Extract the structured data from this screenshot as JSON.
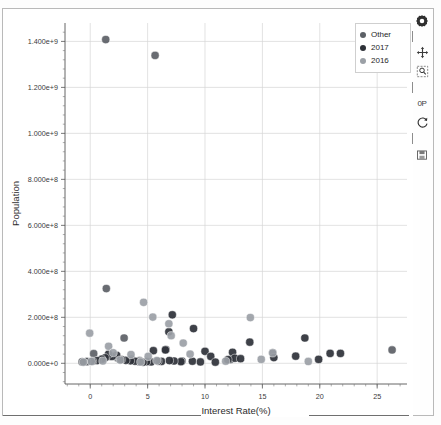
{
  "chart_data": {
    "type": "scatter",
    "title": "",
    "xlabel": "Interest Rate(%)",
    "ylabel": "Population",
    "xlim": [
      -2.2,
      27.6
    ],
    "ylim": [
      -90000000,
      1480000000
    ],
    "xticks": [
      0,
      5,
      10,
      15,
      20,
      25
    ],
    "xticklabels": [
      "0",
      "5",
      "10",
      "15",
      "20",
      "25"
    ],
    "yticks": [
      0,
      200000000,
      400000000,
      600000000,
      800000000,
      1000000000,
      1200000000,
      1400000000
    ],
    "yticklabels": [
      "0.000e+0",
      "2.000e+8",
      "4.000e+8",
      "6.000e+8",
      "8.000e+8",
      "1.000e+9",
      "1.200e+9",
      "1.400e+9"
    ],
    "grid": true,
    "legend_position": "top-right",
    "series": [
      {
        "name": "Other",
        "color": "#5c6066",
        "points": [
          [
            1.35,
            1408000000
          ],
          [
            5.65,
            1339000000
          ],
          [
            1.4,
            325000000
          ],
          [
            2.95,
            110000000
          ],
          [
            0.3,
            42000000
          ],
          [
            1.7,
            30000000
          ],
          [
            2.4,
            22000000
          ],
          [
            3.6,
            18000000
          ],
          [
            4.3,
            12000000
          ],
          [
            6.6,
            60000000
          ],
          [
            8.0,
            10000000
          ],
          [
            12.2,
            16000000
          ],
          [
            15.9,
            46000000
          ],
          [
            26.3,
            58000000
          ]
        ]
      },
      {
        "name": "2017",
        "color": "#2e3138",
        "points": [
          [
            7.15,
            211000000
          ],
          [
            6.85,
            137000000
          ],
          [
            9.0,
            151000000
          ],
          [
            13.9,
            92000000
          ],
          [
            18.7,
            110000000
          ],
          [
            10.0,
            52000000
          ],
          [
            5.5,
            55000000
          ],
          [
            6.55,
            58000000
          ],
          [
            10.5,
            30000000
          ],
          [
            12.4,
            48000000
          ],
          [
            12.6,
            22000000
          ],
          [
            13.1,
            20000000
          ],
          [
            17.9,
            31000000
          ],
          [
            19.9,
            17000000
          ],
          [
            20.9,
            43000000
          ],
          [
            21.8,
            43000000
          ],
          [
            16.0,
            25000000
          ],
          [
            12.0,
            16000000
          ],
          [
            8.9,
            9000000
          ],
          [
            7.9,
            7000000
          ],
          [
            7.3,
            10000000
          ],
          [
            6.9,
            12000000
          ],
          [
            6.2,
            8000000
          ],
          [
            5.9,
            9000000
          ],
          [
            5.3,
            6000000
          ],
          [
            4.9,
            7000000
          ],
          [
            4.6,
            5000000
          ],
          [
            4.3,
            6000000
          ],
          [
            3.9,
            9000000
          ],
          [
            3.5,
            11000000
          ],
          [
            3.1,
            13000000
          ],
          [
            2.7,
            16000000
          ],
          [
            2.3,
            35000000
          ],
          [
            1.9,
            30000000
          ],
          [
            1.6,
            40000000
          ],
          [
            1.3,
            24000000
          ],
          [
            1.0,
            18000000
          ],
          [
            0.6,
            12000000
          ],
          [
            0.2,
            9000000
          ],
          [
            -0.3,
            7000000
          ],
          [
            -0.7,
            6000000
          ],
          [
            9.6,
            6000000
          ],
          [
            10.9,
            5000000
          ]
        ]
      },
      {
        "name": "2016",
        "color": "#9ba0a6",
        "points": [
          [
            4.65,
            265000000
          ],
          [
            5.45,
            201000000
          ],
          [
            13.95,
            199000000
          ],
          [
            6.85,
            172000000
          ],
          [
            -0.05,
            131000000
          ],
          [
            8.1,
            88000000
          ],
          [
            7.05,
            120000000
          ],
          [
            1.6,
            74000000
          ],
          [
            2.0,
            46000000
          ],
          [
            3.55,
            38000000
          ],
          [
            5.05,
            30000000
          ],
          [
            14.9,
            17000000
          ],
          [
            15.9,
            45000000
          ],
          [
            19.0,
            8000000
          ],
          [
            2.6,
            14000000
          ],
          [
            1.1,
            10000000
          ],
          [
            0.1,
            8000000
          ],
          [
            -0.6,
            5000000
          ],
          [
            4.4,
            6000000
          ],
          [
            5.8,
            12000000
          ],
          [
            8.7,
            40000000
          ],
          [
            11.8,
            9000000
          ]
        ]
      }
    ]
  },
  "legend": {
    "items": [
      {
        "label": "Other",
        "color": "#5c6066"
      },
      {
        "label": "2017",
        "color": "#2e3138"
      },
      {
        "label": "2016",
        "color": "#9ba0a6"
      }
    ]
  },
  "toolbar": {
    "items": [
      {
        "name": "settings-gear-icon",
        "glyph": "gear"
      },
      {
        "name": "move-pan-icon",
        "glyph": "move"
      },
      {
        "name": "zoom-select-icon",
        "glyph": "zoom"
      },
      {
        "name": "zero-p-icon",
        "glyph": "0P"
      },
      {
        "name": "refresh-reset-icon",
        "glyph": "refresh"
      },
      {
        "name": "save-image-icon",
        "glyph": "save"
      }
    ]
  }
}
